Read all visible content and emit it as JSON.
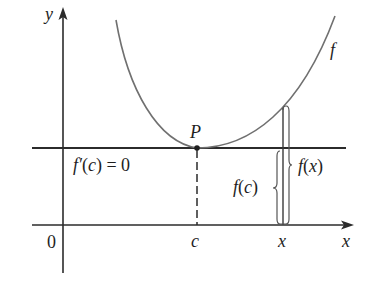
{
  "figure": {
    "colors": {
      "axes": "#2b2b2b",
      "curve": "#707070",
      "braces": "#555555",
      "background": "#ffffff"
    },
    "axes": {
      "x_label": "x",
      "y_label": "y",
      "origin_label": "0"
    },
    "curve": {
      "label": "f"
    },
    "point": {
      "label": "P"
    },
    "ticks": {
      "c_label": "c",
      "x_label": "x"
    },
    "tangent_label": {
      "parts": [
        "f′",
        "(",
        "c",
        ") = 0"
      ]
    },
    "brace_fc": {
      "parts": [
        "f",
        "(",
        "c",
        ")"
      ]
    },
    "brace_fx": {
      "parts": [
        "f",
        "(",
        "x",
        ")"
      ]
    }
  }
}
